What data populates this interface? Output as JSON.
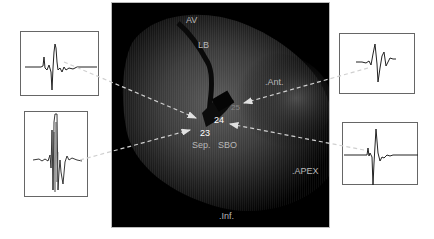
{
  "figure": {
    "type": "cardiac electroanatomical map with electrogram insets",
    "main_image": {
      "anatomical_labels": {
        "av": "AV",
        "lb": "LB",
        "ant": ".Ant.",
        "apex": ".APEX",
        "inf": ".Inf.",
        "sep": "Sep.",
        "sbo": "SBO"
      },
      "point_labels": {
        "p24": "24",
        "p23": "23",
        "p25": "25"
      }
    },
    "electrograms": [
      {
        "id": "top-left",
        "position": "upper-left",
        "target": "point 24 region"
      },
      {
        "id": "bottom-left",
        "position": "lower-left",
        "target": "point 23"
      },
      {
        "id": "top-right",
        "position": "upper-right",
        "target": "point 25"
      },
      {
        "id": "bottom-right",
        "position": "lower-right",
        "target": "point 25 / SBO"
      }
    ],
    "colors": {
      "background": "#ffffff",
      "image_bg": "#000000",
      "label_text": "#b8b8b8",
      "arrow": "#d0d0d0",
      "trace": "#222222",
      "box_border": "#666666"
    }
  }
}
